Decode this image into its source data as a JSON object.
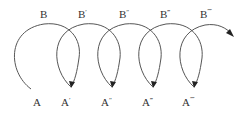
{
  "diagram": {
    "type": "helical loop sequence",
    "stroke_color": "#555555",
    "arrow_color": "#222222",
    "top_labels": [
      {
        "base": "B",
        "prime": "",
        "x": 44,
        "y": 18
      },
      {
        "base": "B",
        "prime": "′",
        "x": 82,
        "y": 18
      },
      {
        "base": "B",
        "prime": "″",
        "x": 123,
        "y": 18
      },
      {
        "base": "B",
        "prime": "‴",
        "x": 164,
        "y": 18
      },
      {
        "base": "B",
        "prime": "⁗",
        "x": 204,
        "y": 18
      }
    ],
    "bottom_labels": [
      {
        "base": "A",
        "prime": "",
        "x": 34,
        "y": 106
      },
      {
        "base": "A",
        "prime": "′",
        "x": 62,
        "y": 106
      },
      {
        "base": "A",
        "prime": "″",
        "x": 102,
        "y": 106
      },
      {
        "base": "A",
        "prime": "‴",
        "x": 143,
        "y": 106
      },
      {
        "base": "A",
        "prime": "⁗",
        "x": 183,
        "y": 106
      }
    ]
  }
}
